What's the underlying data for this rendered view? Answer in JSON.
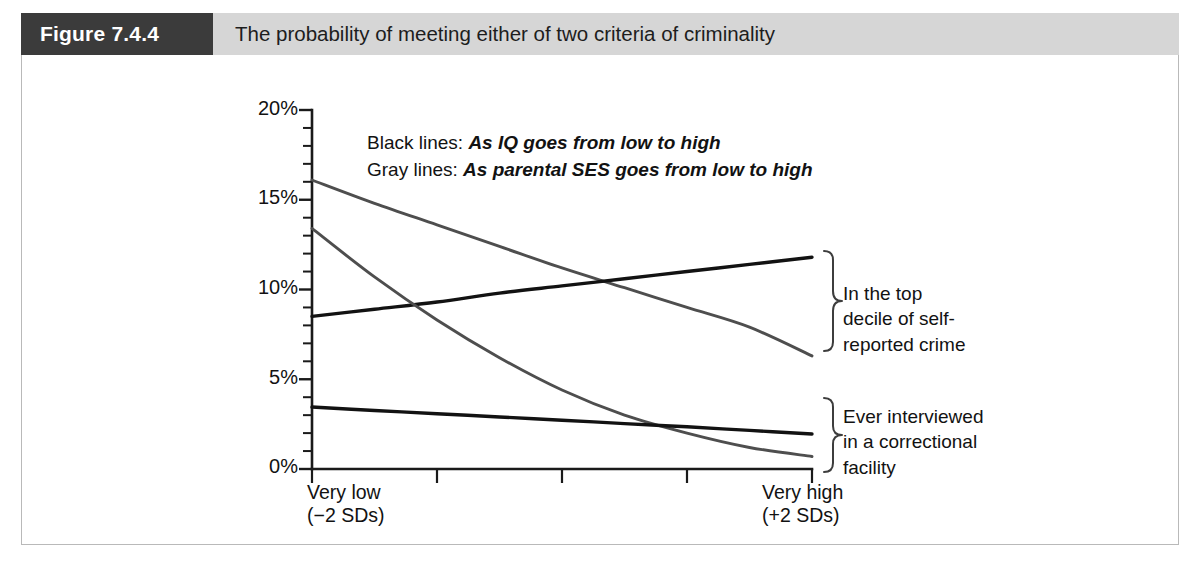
{
  "figure": {
    "label": "Figure 7.4.4",
    "title": "The probability of meeting either of two criteria of criminality"
  },
  "legend": [
    {
      "lead": "Black lines:",
      "desc": "As IQ goes from low to high"
    },
    {
      "lead": "Gray lines:",
      "desc": "As parental SES goes from low to high"
    }
  ],
  "annotations": [
    {
      "id": "top-decile",
      "lines": [
        "In the top",
        "decile of self-",
        "reported crime"
      ]
    },
    {
      "id": "correctional",
      "lines": [
        "Ever interviewed",
        "in a correctional",
        "facility"
      ]
    }
  ],
  "axis": {
    "y_ticks": [
      "0%",
      "5%",
      "10%",
      "15%",
      "20%"
    ],
    "x_left": [
      "Very low",
      "(−2 SDs)"
    ],
    "x_right": [
      "Very high",
      "(+2 SDs)"
    ]
  },
  "chart_data": {
    "type": "line",
    "title": "The probability of meeting either of two criteria of criminality",
    "xlabel": "",
    "ylabel": "",
    "xlim": [
      -2,
      2
    ],
    "ylim": [
      0,
      20
    ],
    "y_unit": "percent",
    "y_major_ticks": [
      0,
      5,
      10,
      15,
      20
    ],
    "y_minor_tick_step": 1,
    "x_tick_positions": [
      -2,
      -1,
      0,
      1,
      2
    ],
    "x_tick_labels": [
      "Very low (−2 SDs)",
      "",
      "",
      "",
      "Very high (+2 SDs)"
    ],
    "grid": false,
    "legend_position": "inside-top-left",
    "x": [
      -2,
      -1.5,
      -1,
      -0.5,
      0,
      0.5,
      1,
      1.5,
      2
    ],
    "series": [
      {
        "name": "Top decile of self-reported crime — by parental SES",
        "color": "#4e4e4e",
        "group": "gray",
        "criterion": "top-decile-self-reported-crime",
        "values": [
          16.1,
          14.8,
          13.6,
          12.4,
          11.2,
          10.1,
          9.0,
          7.9,
          6.3
        ]
      },
      {
        "name": "Top decile of self-reported crime — by IQ",
        "color": "#121212",
        "group": "black",
        "criterion": "top-decile-self-reported-crime",
        "values": [
          8.5,
          8.9,
          9.3,
          9.8,
          10.2,
          10.6,
          11.0,
          11.4,
          11.8
        ]
      },
      {
        "name": "Ever interviewed in a correctional facility — by parental SES",
        "color": "#4e4e4e",
        "group": "gray",
        "criterion": "ever-interviewed-correctional-facility",
        "values": [
          13.4,
          10.7,
          8.3,
          6.2,
          4.4,
          3.0,
          2.0,
          1.2,
          0.7
        ]
      },
      {
        "name": "Ever interviewed in a correctional facility — by IQ",
        "color": "#121212",
        "group": "black",
        "criterion": "ever-interviewed-correctional-facility",
        "values": [
          3.45,
          3.26,
          3.08,
          2.9,
          2.72,
          2.53,
          2.35,
          2.15,
          1.95
        ]
      }
    ],
    "annotations": [
      "Black lines: As IQ goes from low to high",
      "Gray lines: As parental SES goes from low to high",
      "In the top decile of self-reported crime",
      "Ever interviewed in a correctional facility"
    ]
  }
}
